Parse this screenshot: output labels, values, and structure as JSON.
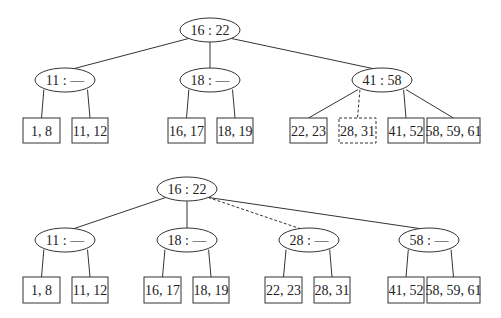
{
  "diagrams": [
    {
      "name": "before",
      "root": {
        "label": "16 : 22",
        "cx": 210,
        "cy": 30
      },
      "internal": [
        {
          "label": "11 : —",
          "cx": 65,
          "cy": 80
        },
        {
          "label": "18 : —",
          "cx": 210,
          "cy": 80
        },
        {
          "label": "41 : 58",
          "cx": 382,
          "cy": 80
        }
      ],
      "leaves": [
        {
          "label": "1, 8",
          "x": 23,
          "y": 118,
          "w": 37,
          "h": 25,
          "parent": 0,
          "dashed": false
        },
        {
          "label": "11, 12",
          "x": 72,
          "y": 118,
          "w": 36,
          "h": 25,
          "parent": 0,
          "dashed": false
        },
        {
          "label": "16, 17",
          "x": 168,
          "y": 118,
          "w": 37,
          "h": 25,
          "parent": 1,
          "dashed": false
        },
        {
          "label": "18, 19",
          "x": 217,
          "y": 118,
          "w": 36,
          "h": 25,
          "parent": 1,
          "dashed": false
        },
        {
          "label": "22, 23",
          "x": 290,
          "y": 118,
          "w": 37,
          "h": 25,
          "parent": 2,
          "dashed": false
        },
        {
          "label": "28, 31",
          "x": 339,
          "y": 118,
          "w": 37,
          "h": 25,
          "parent": 2,
          "dashed": true
        },
        {
          "label": "41, 52",
          "x": 388,
          "y": 118,
          "w": 36,
          "h": 25,
          "parent": 2,
          "dashed": false
        },
        {
          "label": "58, 59, 61",
          "x": 427,
          "y": 118,
          "w": 53,
          "h": 25,
          "parent": 2,
          "dashed": false
        }
      ]
    },
    {
      "name": "after",
      "root": {
        "label": "16 : 22",
        "cx": 187,
        "cy": 189
      },
      "internal": [
        {
          "label": "11 : —",
          "cx": 65,
          "cy": 240,
          "dashed_edge": false
        },
        {
          "label": "18 : —",
          "cx": 187,
          "cy": 240,
          "dashed_edge": false
        },
        {
          "label": "28 : —",
          "cx": 309,
          "cy": 240,
          "dashed_edge": true
        },
        {
          "label": "58 : —",
          "cx": 429,
          "cy": 240,
          "dashed_edge": false
        }
      ],
      "leaves": [
        {
          "label": "1, 8",
          "x": 23,
          "y": 277,
          "w": 37,
          "h": 26,
          "parent": 0
        },
        {
          "label": "11, 12",
          "x": 72,
          "y": 277,
          "w": 36,
          "h": 26,
          "parent": 0
        },
        {
          "label": "16, 17",
          "x": 144,
          "y": 277,
          "w": 37,
          "h": 26,
          "parent": 1
        },
        {
          "label": "18, 19",
          "x": 193,
          "y": 277,
          "w": 36,
          "h": 26,
          "parent": 1
        },
        {
          "label": "22, 23",
          "x": 265,
          "y": 277,
          "w": 37,
          "h": 26,
          "parent": 2
        },
        {
          "label": "28, 31",
          "x": 314,
          "y": 277,
          "w": 36,
          "h": 26,
          "parent": 2
        },
        {
          "label": "41, 52",
          "x": 388,
          "y": 277,
          "w": 36,
          "h": 26,
          "parent": 3
        },
        {
          "label": "58, 59, 61",
          "x": 427,
          "y": 277,
          "w": 53,
          "h": 26,
          "parent": 3
        }
      ]
    }
  ]
}
